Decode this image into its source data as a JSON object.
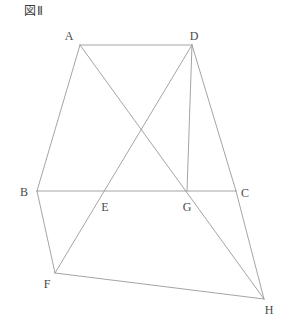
{
  "figure": {
    "title": "図Ⅱ",
    "stroke_color": "#9a9a9a",
    "label_color": "#4a4a4a",
    "background_color": "#ffffff",
    "width": 289,
    "height": 326
  },
  "points": [
    {
      "name": "A",
      "x": 80,
      "y": 45,
      "label_x": 69,
      "label_y": 36
    },
    {
      "name": "D",
      "x": 192,
      "y": 45,
      "label_x": 194,
      "label_y": 36
    },
    {
      "name": "B",
      "x": 37,
      "y": 191,
      "label_x": 24,
      "label_y": 192
    },
    {
      "name": "E",
      "x": 104,
      "y": 191,
      "label_x": 105,
      "label_y": 207
    },
    {
      "name": "G",
      "x": 187,
      "y": 191,
      "label_x": 187,
      "label_y": 207
    },
    {
      "name": "C",
      "x": 236,
      "y": 191,
      "label_x": 245,
      "label_y": 193
    },
    {
      "name": "F",
      "x": 55,
      "y": 273,
      "label_x": 47,
      "label_y": 284
    },
    {
      "name": "H",
      "x": 264,
      "y": 299,
      "label_x": 269,
      "label_y": 310
    }
  ],
  "segments": [
    {
      "name": "A-D",
      "x1": 80,
      "y1": 45,
      "x2": 192,
      "y2": 45
    },
    {
      "name": "A-B",
      "x1": 80,
      "y1": 45,
      "x2": 37,
      "y2": 191
    },
    {
      "name": "A-H",
      "x1": 80,
      "y1": 45,
      "x2": 264,
      "y2": 299
    },
    {
      "name": "D-F",
      "x1": 192,
      "y1": 45,
      "x2": 55,
      "y2": 273
    },
    {
      "name": "D-G",
      "x1": 192,
      "y1": 45,
      "x2": 187,
      "y2": 191
    },
    {
      "name": "D-C",
      "x1": 192,
      "y1": 45,
      "x2": 236,
      "y2": 191
    },
    {
      "name": "B-C",
      "x1": 37,
      "y1": 191,
      "x2": 236,
      "y2": 191
    },
    {
      "name": "B-F",
      "x1": 37,
      "y1": 191,
      "x2": 55,
      "y2": 273
    },
    {
      "name": "F-H",
      "x1": 55,
      "y1": 273,
      "x2": 264,
      "y2": 299
    },
    {
      "name": "C-H",
      "x1": 236,
      "y1": 191,
      "x2": 264,
      "y2": 299
    }
  ]
}
